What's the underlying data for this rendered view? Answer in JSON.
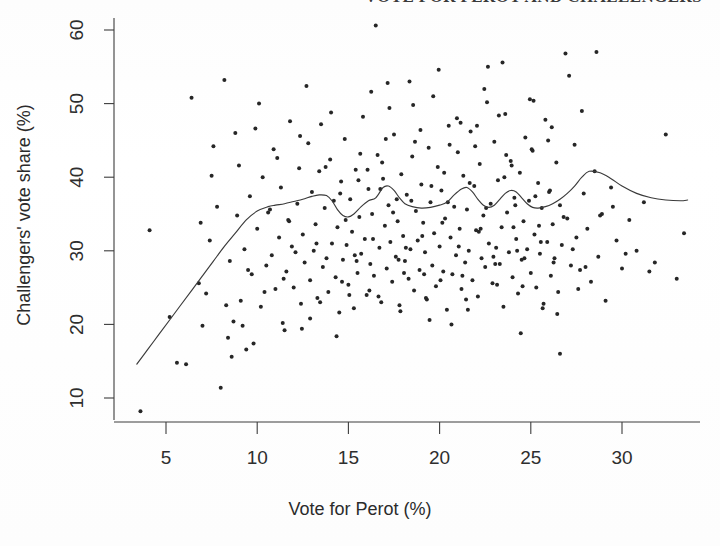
{
  "figure": {
    "clipped_title": "VOTE FOR PEROT AND CHALLENGERS",
    "background_color": "#fefefe",
    "ink_color": "#2b2b2b"
  },
  "chart_data": {
    "type": "scatter",
    "title": "",
    "xlabel": "Vote for Perot (%)",
    "ylabel": "Challengers' vote share (%)",
    "xlim": [
      2.2,
      34.2
    ],
    "ylim": [
      7.0,
      62.0
    ],
    "xticks": [
      5,
      10,
      15,
      20,
      25,
      30
    ],
    "yticks": [
      10,
      20,
      30,
      40,
      50,
      60
    ],
    "xticklabels": [
      "5",
      "10",
      "15",
      "20",
      "25",
      "30"
    ],
    "yticklabels": [
      "10",
      "20",
      "30",
      "40",
      "50",
      "60"
    ],
    "grid": false,
    "legend": null,
    "point_color": "#262626",
    "point_size": 2.0,
    "series": [
      {
        "name": "districts",
        "type": "scatter",
        "x": [
          3.6,
          4.1,
          5.2,
          5.6,
          6.1,
          6.4,
          6.8,
          7.0,
          7.2,
          7.4,
          7.6,
          7.8,
          8.0,
          8.2,
          8.4,
          8.5,
          8.7,
          8.9,
          9.0,
          9.1,
          9.3,
          9.4,
          9.6,
          9.7,
          9.9,
          10.0,
          10.2,
          10.3,
          10.5,
          10.6,
          10.8,
          10.9,
          11.0,
          11.2,
          11.3,
          11.4,
          11.6,
          11.7,
          11.8,
          11.9,
          12.0,
          12.2,
          12.3,
          12.4,
          12.5,
          12.6,
          12.8,
          12.9,
          13.0,
          13.1,
          13.2,
          13.3,
          13.4,
          13.6,
          13.7,
          13.8,
          13.9,
          14.0,
          14.1,
          14.2,
          14.3,
          14.4,
          14.5,
          14.6,
          14.7,
          14.8,
          14.9,
          15.0,
          15.1,
          15.2,
          15.3,
          15.4,
          15.5,
          15.6,
          15.7,
          15.8,
          15.9,
          16.0,
          16.1,
          16.2,
          16.3,
          16.4,
          16.5,
          16.6,
          16.7,
          16.8,
          16.9,
          17.0,
          17.1,
          17.2,
          17.3,
          17.4,
          17.5,
          17.6,
          17.7,
          17.8,
          17.9,
          18.0,
          18.1,
          18.2,
          18.3,
          18.4,
          18.5,
          18.6,
          18.7,
          18.8,
          18.9,
          19.0,
          19.1,
          19.2,
          19.3,
          19.4,
          19.5,
          19.6,
          19.7,
          19.8,
          19.9,
          20.0,
          20.1,
          20.2,
          20.3,
          20.4,
          20.5,
          20.6,
          20.7,
          20.8,
          20.9,
          21.0,
          21.1,
          21.2,
          21.3,
          21.4,
          21.5,
          21.6,
          21.7,
          21.8,
          21.9,
          22.0,
          22.1,
          22.2,
          22.3,
          22.4,
          22.5,
          22.6,
          22.7,
          22.8,
          22.9,
          23.0,
          23.1,
          23.2,
          23.3,
          23.4,
          23.5,
          23.6,
          23.7,
          23.8,
          23.9,
          24.0,
          24.1,
          24.2,
          24.3,
          24.4,
          24.5,
          24.6,
          24.7,
          24.8,
          24.9,
          25.0,
          25.1,
          25.2,
          25.3,
          25.4,
          25.5,
          25.6,
          25.7,
          25.8,
          25.9,
          26.0,
          26.1,
          26.2,
          26.3,
          26.4,
          26.5,
          26.6,
          26.7,
          26.9,
          27.0,
          27.2,
          27.4,
          27.5,
          27.7,
          27.9,
          28.1,
          28.3,
          28.5,
          28.7,
          28.9,
          29.1,
          29.4,
          29.7,
          30.0,
          30.4,
          30.8,
          31.2,
          31.8,
          32.4,
          33.0,
          33.4,
          6.9,
          7.5,
          8.3,
          8.8,
          9.5,
          10.1,
          10.7,
          11.1,
          11.5,
          12.1,
          12.7,
          13.5,
          14.35,
          15.05,
          15.65,
          16.25,
          16.75,
          17.25,
          17.85,
          18.35,
          18.95,
          19.45,
          19.95,
          20.45,
          20.95,
          21.45,
          21.95,
          22.45,
          22.95,
          23.45,
          23.95,
          24.45,
          24.95,
          25.45,
          25.95,
          26.45,
          27.1,
          27.8,
          28.6,
          29.5,
          8.6,
          9.8,
          11.45,
          12.35,
          13.25,
          14.05,
          14.85,
          15.45,
          16.05,
          16.65,
          17.15,
          17.65,
          18.15,
          18.65,
          19.15,
          19.65,
          20.15,
          20.65,
          21.15,
          21.65,
          22.15,
          22.65,
          23.15,
          23.65,
          24.15,
          24.65,
          25.15,
          25.65,
          26.15,
          26.8,
          12.45,
          13.45,
          14.55,
          15.35,
          16.15,
          16.85,
          17.45,
          18.05,
          18.55,
          19.05,
          19.55,
          20.05,
          20.55,
          21.05,
          21.55,
          22.05,
          22.55,
          23.05,
          23.55,
          24.05,
          24.55,
          25.05,
          25.55,
          26.05,
          26.6,
          27.3,
          28.0,
          28.8,
          30.2,
          31.5,
          9.2,
          10.4,
          11.75,
          12.9,
          13.75,
          14.65,
          15.55,
          16.35,
          17.05,
          17.75,
          18.45,
          19.25,
          20.25,
          21.25,
          22.25,
          23.25,
          24.25,
          25.25,
          26.25,
          27.6
        ],
        "y": [
          8.2,
          32.8,
          21.0,
          14.8,
          14.6,
          50.8,
          25.6,
          19.8,
          24.2,
          31.4,
          44.2,
          36.0,
          11.4,
          53.2,
          18.2,
          28.6,
          20.4,
          34.8,
          41.6,
          23.2,
          30.2,
          16.6,
          37.4,
          26.8,
          46.6,
          33.0,
          22.4,
          40.0,
          28.0,
          35.2,
          29.4,
          43.8,
          24.8,
          31.8,
          38.6,
          20.2,
          27.2,
          34.2,
          47.6,
          30.6,
          25.0,
          36.4,
          41.2,
          22.8,
          32.2,
          28.4,
          44.6,
          26.0,
          38.0,
          30.0,
          33.6,
          23.6,
          40.8,
          27.8,
          35.8,
          29.0,
          24.4,
          42.4,
          31.0,
          36.8,
          26.4,
          33.2,
          21.6,
          39.4,
          28.8,
          45.2,
          30.8,
          25.4,
          37.0,
          32.6,
          22.2,
          41.0,
          27.0,
          34.6,
          29.6,
          48.2,
          31.6,
          24.0,
          38.4,
          28.2,
          35.0,
          26.6,
          60.6,
          43.0,
          30.4,
          23.0,
          39.8,
          33.4,
          27.6,
          36.2,
          31.2,
          25.8,
          45.8,
          29.2,
          34.0,
          22.6,
          40.4,
          32.0,
          28.6,
          37.6,
          26.2,
          30.2,
          42.8,
          24.6,
          35.4,
          31.4,
          27.4,
          39.0,
          33.8,
          29.8,
          23.4,
          44.0,
          36.6,
          28.0,
          32.4,
          25.2,
          41.4,
          30.6,
          38.2,
          27.2,
          34.4,
          22.0,
          47.0,
          31.8,
          26.8,
          36.0,
          29.4,
          43.4,
          33.0,
          24.8,
          40.2,
          28.4,
          35.6,
          30.0,
          46.2,
          26.0,
          38.8,
          32.8,
          23.8,
          41.8,
          29.0,
          34.8,
          27.8,
          50.2,
          31.0,
          36.4,
          25.6,
          44.8,
          30.4,
          39.6,
          28.2,
          33.2,
          22.4,
          48.6,
          35.2,
          29.8,
          42.2,
          26.4,
          37.2,
          31.6,
          24.2,
          40.6,
          28.8,
          34.0,
          45.4,
          30.2,
          36.8,
          27.0,
          43.6,
          32.2,
          25.0,
          39.2,
          29.6,
          35.8,
          22.8,
          47.8,
          31.2,
          38.0,
          26.6,
          33.6,
          29.0,
          42.0,
          24.4,
          36.2,
          30.8,
          56.8,
          34.4,
          28.0,
          44.4,
          31.8,
          27.4,
          37.8,
          33.0,
          25.8,
          40.8,
          29.2,
          35.0,
          23.2,
          38.6,
          31.4,
          27.6,
          34.2,
          30.0,
          36.6,
          28.4,
          45.8,
          26.2,
          32.4,
          33.8,
          40.2,
          22.6,
          46.0,
          27.4,
          50.0,
          35.6,
          42.6,
          19.2,
          29.8,
          52.4,
          47.2,
          18.4,
          24.0,
          43.2,
          51.6,
          38.4,
          49.4,
          21.8,
          53.0,
          46.4,
          20.6,
          54.6,
          36.6,
          48.0,
          23.4,
          44.2,
          52.0,
          29.2,
          55.6,
          41.6,
          18.8,
          50.6,
          33.4,
          45.0,
          21.4,
          53.8,
          49.0,
          57.0,
          36.0,
          15.6,
          17.4,
          26.2,
          45.6,
          31.0,
          48.8,
          34.2,
          28.6,
          41.0,
          23.8,
          52.8,
          37.0,
          30.4,
          44.8,
          26.8,
          51.0,
          33.8,
          20.0,
          47.4,
          39.2,
          32.6,
          55.0,
          25.4,
          43.0,
          36.2,
          29.0,
          50.4,
          22.2,
          46.8,
          34.6,
          19.4,
          23.0,
          37.8,
          29.4,
          24.6,
          42.0,
          35.2,
          27.0,
          49.8,
          32.0,
          38.8,
          26.0,
          44.4,
          30.6,
          22.0,
          47.0,
          35.8,
          28.2,
          40.0,
          33.2,
          25.2,
          43.8,
          31.2,
          38.2,
          16.0,
          30.2,
          27.8,
          34.8,
          29.6,
          27.2,
          19.8,
          24.4,
          34.0,
          20.8,
          41.4,
          25.8,
          39.6,
          31.6,
          45.2,
          28.8,
          36.8,
          23.6,
          40.6,
          26.6,
          33.0,
          48.4,
          30.0,
          37.4,
          28.4,
          24.8
        ]
      }
    ],
    "smooth_curve": {
      "name": "lowess-smoother",
      "color": "#3a3a3a",
      "x": [
        3.4,
        4.0,
        4.6,
        5.2,
        5.8,
        6.4,
        7.0,
        7.6,
        8.2,
        8.8,
        9.4,
        10.0,
        10.6,
        11.0,
        11.5,
        12.0,
        12.5,
        13.0,
        13.4,
        13.8,
        14.1,
        14.4,
        14.7,
        15.0,
        15.3,
        15.7,
        16.1,
        16.5,
        16.9,
        17.2,
        17.5,
        17.8,
        18.1,
        18.5,
        19.0,
        19.5,
        20.0,
        20.4,
        20.8,
        21.2,
        21.5,
        21.8,
        22.1,
        22.4,
        22.7,
        23.0,
        23.3,
        23.6,
        23.9,
        24.2,
        24.5,
        24.8,
        25.1,
        25.4,
        25.8,
        26.2,
        26.6,
        27.0,
        27.4,
        27.8,
        28.2,
        28.8,
        29.4,
        30.0,
        30.8,
        31.6,
        32.4,
        33.2,
        33.6
      ],
      "y": [
        14.6,
        16.6,
        18.6,
        20.6,
        22.6,
        24.6,
        26.6,
        28.6,
        30.6,
        32.4,
        34.2,
        35.4,
        36.0,
        36.2,
        36.4,
        36.7,
        37.0,
        37.4,
        37.6,
        37.5,
        36.8,
        35.6,
        34.8,
        34.6,
        35.0,
        36.0,
        36.8,
        37.2,
        38.6,
        38.8,
        38.2,
        37.2,
        36.4,
        36.0,
        35.8,
        35.9,
        36.2,
        36.6,
        37.6,
        38.4,
        38.6,
        38.0,
        37.0,
        36.2,
        35.9,
        36.2,
        37.0,
        37.8,
        38.2,
        38.0,
        37.2,
        36.4,
        35.9,
        35.8,
        36.0,
        36.4,
        37.0,
        37.8,
        38.8,
        40.0,
        40.8,
        40.6,
        39.8,
        38.8,
        37.8,
        37.2,
        36.9,
        36.8,
        36.9
      ]
    }
  }
}
